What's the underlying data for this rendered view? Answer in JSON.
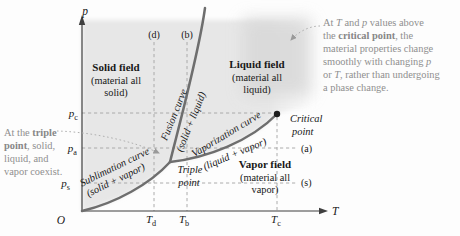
{
  "colors": {
    "curve": "#6e6e6e",
    "axis": "#3f3f3f",
    "guide_dash": "#a3a3a3",
    "text": "#171717",
    "note_gray": "#8f8f8f",
    "region_shade": "#e7e7e7",
    "supercritical_shade": "#d8d8d8"
  },
  "axes": {
    "p_label": "p",
    "t_label": "T",
    "origin": "O"
  },
  "ticks": {
    "pc": {
      "base": "p",
      "sub": "c"
    },
    "pa": {
      "base": "p",
      "sub": "a"
    },
    "ps": {
      "base": "p",
      "sub": "s"
    },
    "td": {
      "base": "T",
      "sub": "d"
    },
    "tb": {
      "base": "T",
      "sub": "b"
    },
    "tc": {
      "base": "T",
      "sub": "c"
    }
  },
  "tags": {
    "d": "(d)",
    "b": "(b)",
    "a": "(a)",
    "s": "(s)"
  },
  "regions": {
    "solid": {
      "title": "Solid field",
      "line2": "(material all",
      "line3": "solid)"
    },
    "liquid": {
      "title": "Liquid field",
      "line2": "(material all",
      "line3": "liquid)"
    },
    "vapor": {
      "title": "Vapor field",
      "line2": "(material all",
      "line3": "vapor)"
    }
  },
  "curves": {
    "fusion": {
      "name": "Fusion curve",
      "phases": "(solid + liquid)"
    },
    "vaporization": {
      "name": "Vaporization curve",
      "phases": "(liquid + vapor)"
    },
    "sublimation": {
      "name": "Sublimation curve",
      "phases": "(solid + vapor)"
    }
  },
  "points": {
    "triple": {
      "line1": "Triple",
      "line2": "point"
    },
    "critical": {
      "line1": "Critical",
      "line2": "point"
    }
  },
  "notes": {
    "left": {
      "l1a": "At the ",
      "l1b": "triple",
      "l2a": "point",
      "l2b": ", solid,",
      "l3": "liquid, and",
      "l4": "vapor coexist."
    },
    "right": {
      "l1a": "At ",
      "l1b": "T",
      "l1c": " and ",
      "l1d": "p",
      "l1e": " values above",
      "l2a": "the ",
      "l2b": "critical point",
      "l2c": ", the",
      "l3": "material properties change",
      "l4a": "smoothly with changing ",
      "l4b": "p",
      "l5a": "or ",
      "l5b": "T",
      "l5c": ", rather than undergoing",
      "l6": "a phase change."
    }
  }
}
